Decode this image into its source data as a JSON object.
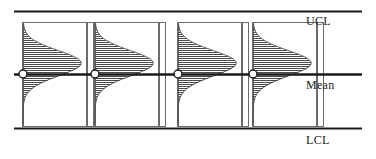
{
  "figure": {
    "title": "",
    "labels": {
      "ucl": "UCL",
      "mean": "Mean",
      "lcl": "LCL"
    },
    "colors": {
      "line": "#1a1a1a",
      "hatch": "#4a4a4a",
      "box_border": "#6b6b6b",
      "marker_fill": "#ffffff",
      "background": "#ffffff"
    }
  },
  "chart_data": {
    "type": "line",
    "title": "",
    "xlabel": "",
    "ylabel": "",
    "grid": false,
    "legend": null,
    "axis_lines": [
      {
        "name": "UCL",
        "label": "UCL",
        "y_px": 11,
        "style": "heavy"
      },
      {
        "name": "Mean",
        "label": "Mean",
        "y_px": 74,
        "style": "heavy"
      },
      {
        "name": "LCL",
        "label": "LCL",
        "y_px": 128,
        "style": "heavy"
      }
    ],
    "x": [
      1,
      2,
      3,
      4
    ],
    "series": [
      {
        "name": "Subgroup mean",
        "values": [
          0,
          0,
          0,
          0
        ],
        "marker": "open-circle",
        "points_px": [
          {
            "x": 23,
            "y": 74
          },
          {
            "x": 95,
            "y": 74
          },
          {
            "x": 178,
            "y": 74
          },
          {
            "x": 253,
            "y": 74
          }
        ]
      }
    ],
    "distributions": [
      {
        "index": 1,
        "label": "Subgroup 1 distribution",
        "shape": "right-skewed",
        "box_px": {
          "x": 22,
          "y": 22,
          "w": 64,
          "h": 104
        },
        "strip_px": {
          "x": 87,
          "y": 22,
          "w": 6,
          "h": 104
        },
        "baseline_x_px": 23,
        "peak_offset_from_mean_px": -18,
        "max_width_px": 58
      },
      {
        "index": 2,
        "label": "Subgroup 2 distribution",
        "shape": "right-skewed",
        "box_px": {
          "x": 94,
          "y": 22,
          "w": 64,
          "h": 104
        },
        "strip_px": {
          "x": 159,
          "y": 22,
          "w": 6,
          "h": 104
        },
        "baseline_x_px": 95,
        "peak_offset_from_mean_px": -18,
        "max_width_px": 58
      },
      {
        "index": 3,
        "label": "Subgroup 3 distribution",
        "shape": "right-skewed",
        "box_px": {
          "x": 177,
          "y": 22,
          "w": 64,
          "h": 104
        },
        "strip_px": {
          "x": 242,
          "y": 22,
          "w": 6,
          "h": 104
        },
        "baseline_x_px": 178,
        "peak_offset_from_mean_px": -18,
        "max_width_px": 58
      },
      {
        "index": 4,
        "label": "Subgroup 4 distribution",
        "shape": "right-skewed",
        "box_px": {
          "x": 252,
          "y": 22,
          "w": 64,
          "h": 104
        },
        "strip_px": {
          "x": 317,
          "y": 22,
          "w": 6,
          "h": 104
        },
        "baseline_x_px": 253,
        "peak_offset_from_mean_px": -18,
        "max_width_px": 58
      }
    ]
  }
}
